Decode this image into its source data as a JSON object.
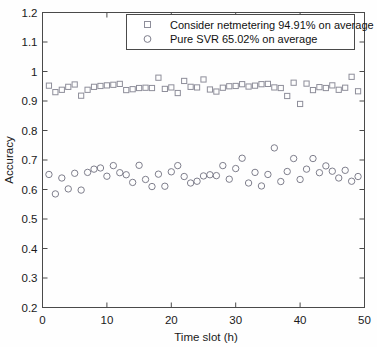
{
  "chart_data": {
    "type": "scatter",
    "title": "",
    "xlabel": "Time slot (h)",
    "ylabel": "Accuracy",
    "xlim": [
      0,
      50
    ],
    "ylim": [
      0.2,
      1.2
    ],
    "xticks": [
      0,
      10,
      20,
      30,
      40,
      50
    ],
    "yticks": [
      0.2,
      0.3,
      0.4,
      0.5,
      0.6,
      0.7,
      0.8,
      0.9,
      1,
      1.1,
      1.2
    ],
    "grid": false,
    "legend_position": "top-center",
    "series": [
      {
        "name": "Consider netmetering 94.91% on average",
        "marker": "square",
        "color": "#8e8e9a",
        "average": 94.91,
        "x": [
          1,
          2,
          3,
          4,
          5,
          6,
          7,
          8,
          9,
          10,
          11,
          12,
          13,
          14,
          15,
          16,
          17,
          18,
          19,
          20,
          21,
          22,
          23,
          24,
          25,
          26,
          27,
          28,
          29,
          30,
          31,
          32,
          33,
          34,
          35,
          36,
          37,
          38,
          39,
          40,
          41,
          42,
          43,
          44,
          45,
          46,
          47,
          48,
          49
        ],
        "values": [
          0.952,
          0.93,
          0.938,
          0.948,
          0.956,
          0.918,
          0.938,
          0.948,
          0.951,
          0.953,
          0.955,
          0.958,
          0.937,
          0.94,
          0.944,
          0.945,
          0.944,
          0.979,
          0.941,
          0.946,
          0.927,
          0.968,
          0.948,
          0.946,
          0.973,
          0.939,
          0.932,
          0.945,
          0.95,
          0.951,
          0.957,
          0.949,
          0.952,
          0.957,
          0.958,
          0.946,
          0.944,
          0.917,
          0.962,
          0.89,
          0.959,
          0.937,
          0.947,
          0.944,
          0.953,
          0.938,
          0.945,
          0.982,
          0.933
        ]
      },
      {
        "name": "Pure SVR 65.02% on average",
        "marker": "circle",
        "color": "#7e7e8c",
        "average": 65.02,
        "x": [
          1,
          2,
          3,
          4,
          5,
          6,
          7,
          8,
          9,
          10,
          11,
          12,
          13,
          14,
          15,
          16,
          17,
          18,
          19,
          20,
          21,
          22,
          23,
          24,
          25,
          26,
          27,
          28,
          29,
          30,
          31,
          32,
          33,
          34,
          35,
          36,
          37,
          38,
          39,
          40,
          41,
          42,
          43,
          44,
          45,
          46,
          47,
          48,
          49
        ],
        "values": [
          0.651,
          0.585,
          0.639,
          0.602,
          0.655,
          0.598,
          0.658,
          0.669,
          0.673,
          0.645,
          0.681,
          0.657,
          0.65,
          0.624,
          0.682,
          0.634,
          0.61,
          0.652,
          0.611,
          0.66,
          0.681,
          0.644,
          0.622,
          0.628,
          0.646,
          0.65,
          0.647,
          0.681,
          0.635,
          0.671,
          0.706,
          0.622,
          0.658,
          0.612,
          0.651,
          0.741,
          0.627,
          0.661,
          0.705,
          0.634,
          0.669,
          0.705,
          0.657,
          0.68,
          0.662,
          0.639,
          0.665,
          0.628,
          0.644
        ]
      }
    ]
  },
  "legend": {
    "entries": [
      {
        "label": "Consider netmetering 94.91% on average",
        "marker": "square"
      },
      {
        "label": "Pure SVR 65.02% on average",
        "marker": "circle"
      }
    ]
  },
  "axes": {
    "y_title": "Accuracy",
    "x_title": "Time slot (h)",
    "y_tick_labels": [
      "1.2",
      "1.1",
      "1",
      "0.9",
      "0.8",
      "0.7",
      "0.6",
      "0.5",
      "0.4",
      "0.3",
      "0.2"
    ],
    "x_tick_labels": [
      "0",
      "10",
      "20",
      "30",
      "40",
      "50"
    ]
  },
  "colors": {
    "axis": "#4a4a4a",
    "series_square": "#8e8e9a",
    "series_circle": "#7e7e8c",
    "background": "#fefefe"
  }
}
